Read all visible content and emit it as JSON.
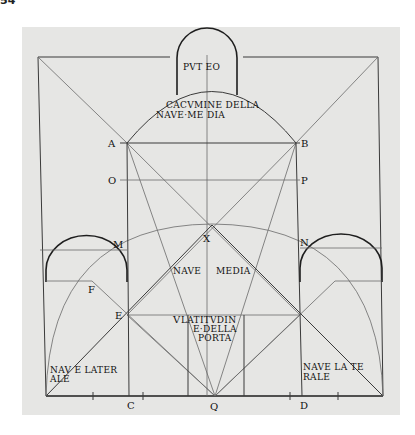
{
  "page": {
    "number": "54"
  },
  "figure": {
    "points": {
      "A": "A",
      "B": "B",
      "O": "O",
      "P": "P",
      "M": "M",
      "N": "N",
      "X": "X",
      "F": "F",
      "E": "E",
      "V": "V",
      "C": "C",
      "Q": "Q",
      "D": "D"
    },
    "labels": {
      "puteo": "PVT EO",
      "cacumine_1": "CACVMINE DELLA",
      "cacumine_2": "NAVE·ME DIA",
      "nave_media_1": "NAVE",
      "nave_media_2": "MEDIA",
      "latitudine_1": "LATITVDIN",
      "latitudine_2": "E·DELLA",
      "latitudine_3": "PORTA",
      "nave_laterale_left_1": "NAV E LATER",
      "nave_laterale_left_2": "ALE",
      "nave_laterale_right_1": "NAVE LA TE",
      "nave_laterale_right_2": "RALE"
    },
    "colors": {
      "paper": "#e6e6e4",
      "ink": "#1e1e1e"
    }
  }
}
